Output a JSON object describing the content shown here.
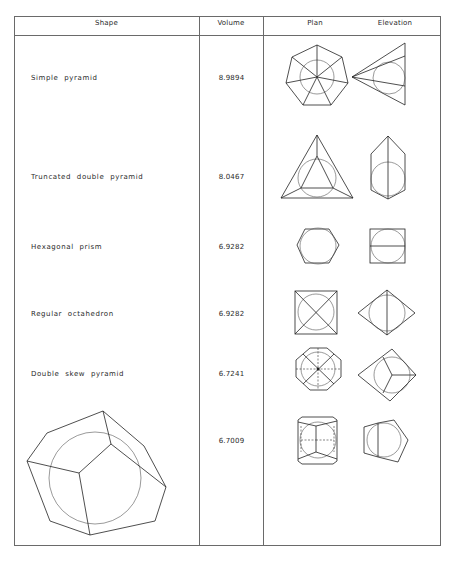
{
  "table": {
    "headers": {
      "shape": "Shape",
      "volume": "Volume",
      "plan": "Plan",
      "elevation": "Elevation"
    },
    "rows": [
      {
        "shape": "Simple pyramid",
        "volume": "8.9894"
      },
      {
        "shape": "Truncated double pyramid",
        "volume": "8.0467"
      },
      {
        "shape": "Hexagonal prism",
        "volume": "6.9282"
      },
      {
        "shape": "Regular octahedron",
        "volume": "6.9282"
      },
      {
        "shape": "Double skew pyramid",
        "volume": "6.7241"
      },
      {
        "shape": "",
        "volume": "6.7009",
        "shape_is_drawing": true
      }
    ]
  }
}
